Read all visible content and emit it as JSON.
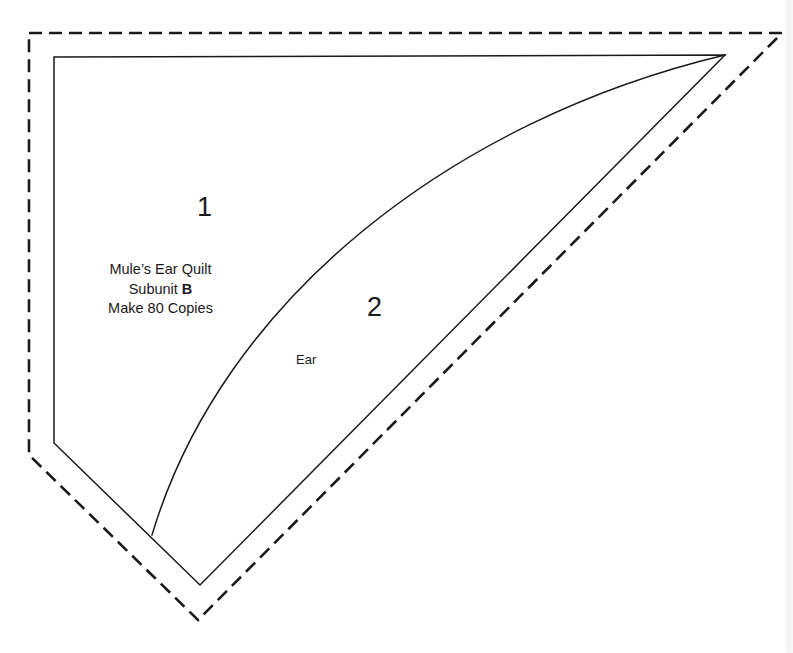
{
  "document": {
    "type": "quilt-paper-piecing-template",
    "background_color": "#ffffff",
    "line_color": "#1a1a1a",
    "width": 793,
    "height": 653
  },
  "labels": {
    "region_1_number": "1",
    "region_2_number": "2",
    "ear_label": "Ear",
    "top_clipped_text": ""
  },
  "info_block": {
    "line1": "Mule’s Ear Quilt",
    "line2_prefix": "Subunit ",
    "line2_bold": "B",
    "line3": "Make 80 Copies"
  },
  "geometry": {
    "seam_allowance_outline": {
      "style": "dashed",
      "dash_pattern": "13 7",
      "stroke_width": 2.6,
      "points": "29,33 782,33 198,620 29,455"
    },
    "sewing_line_outline": {
      "style": "solid",
      "stroke_width": 1.5,
      "points": "54,57 725,55 200,585 54,443"
    },
    "curved_divider": {
      "style": "solid",
      "stroke_width": 1.5,
      "from": "725,55",
      "to": "152,535",
      "control_1": "452,120",
      "control_2": "222,300"
    }
  },
  "chart_data": {
    "type": "table",
    "categories": [
      "1",
      "2"
    ],
    "values": [
      1,
      2
    ],
    "xlabel": "",
    "ylabel": "",
    "annotations": [
      "Ear",
      "Make 80 Copies"
    ]
  }
}
